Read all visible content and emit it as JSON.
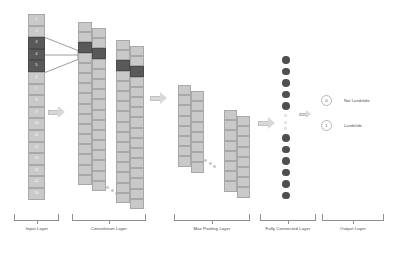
{
  "diagram": {
    "colors": {
      "cell_light": "#c9c9c9",
      "cell_dark": "#595959",
      "node_dark": "#4f4f4f",
      "arrow": "#d8d8d8",
      "brace": "#8e8e8e",
      "text": "#3f3f3f"
    }
  },
  "input_layer": {
    "caption": "Input Layer",
    "cells": [
      {
        "label": "1",
        "highlighted": false
      },
      {
        "label": "2",
        "highlighted": false
      },
      {
        "label": "3",
        "highlighted": true
      },
      {
        "label": "4",
        "highlighted": true
      },
      {
        "label": "5",
        "highlighted": true
      },
      {
        "label": "6",
        "highlighted": false
      },
      {
        "label": "7",
        "highlighted": false
      },
      {
        "label": "8",
        "highlighted": false
      },
      {
        "label": "9",
        "highlighted": false
      },
      {
        "label": "10",
        "highlighted": false
      },
      {
        "label": "11",
        "highlighted": false
      },
      {
        "label": "12",
        "highlighted": false
      },
      {
        "label": "13",
        "highlighted": false
      },
      {
        "label": "14",
        "highlighted": false
      },
      {
        "label": "15",
        "highlighted": false
      },
      {
        "label": "16",
        "highlighted": false
      }
    ]
  },
  "convolution_layer": {
    "caption": "Convolution Layer"
  },
  "max_pooling_layer": {
    "caption": "Max Pooling Layer"
  },
  "fully_connected_layer": {
    "caption": "Fully Connected Layer",
    "nodes_above_gap": 5,
    "gap_dots": 3,
    "nodes_below_gap": 6
  },
  "output_layer": {
    "caption": "Output Layer",
    "nodes": [
      {
        "value": "0",
        "label": "Not Landslide"
      },
      {
        "value": "1",
        "label": "Landslide"
      }
    ]
  }
}
